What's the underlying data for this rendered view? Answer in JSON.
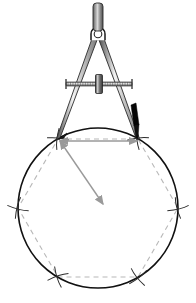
{
  "figure": {
    "background_color": "#ffffff",
    "width": 196,
    "height": 303
  },
  "colors": {
    "ink_black": "#1a1a1a",
    "circle_stroke": "#111111",
    "construction_grey": "#b3b3b3",
    "arrow_grey": "#9a9a9a",
    "metal_light": "#f2f2f2",
    "metal_mid": "#b8b8b8",
    "metal_dark": "#4a4a4a",
    "lead_black": "#000000",
    "handle_fill": "#8c8c8c"
  },
  "circle": {
    "label": "construction-circle",
    "center_x": 98,
    "center_y": 208,
    "radius": 80,
    "stroke_width": 1.6,
    "stroke_color": "#111111"
  },
  "hexagon": {
    "label": "inscribed-hexagon",
    "sides": 6,
    "style": "dashed",
    "stroke_color": "#b8b8b8",
    "stroke_width": 1.1,
    "dash_pattern": "5 4",
    "vertices": [
      {
        "name": "vertex-top-left",
        "x": 58,
        "y": 139
      },
      {
        "name": "vertex-top-right",
        "x": 138,
        "y": 139
      },
      {
        "name": "vertex-right",
        "x": 178,
        "y": 208
      },
      {
        "name": "vertex-bottom-right",
        "x": 138,
        "y": 277
      },
      {
        "name": "vertex-bottom-left",
        "x": 58,
        "y": 277
      },
      {
        "name": "vertex-left",
        "x": 18,
        "y": 208
      }
    ]
  },
  "arc_marks": {
    "label": "compass-arc-crossings",
    "stroke_color": "#2b2b2b",
    "stroke_width": 1.0,
    "marks": [
      {
        "name": "arc-mark-left",
        "x": 18,
        "y": 208,
        "rotation": 14
      },
      {
        "name": "arc-mark-right",
        "x": 178,
        "y": 208,
        "rotation": -14
      },
      {
        "name": "arc-mark-bottom-left",
        "x": 58,
        "y": 277,
        "rotation": 72
      },
      {
        "name": "arc-mark-bottom-right",
        "x": 138,
        "y": 277,
        "rotation": -38
      },
      {
        "name": "arc-mark-top-left",
        "x": 58,
        "y": 139,
        "rotation": 96
      },
      {
        "name": "arc-mark-top-right",
        "x": 138,
        "y": 139,
        "rotation": 84
      }
    ]
  },
  "radius_arrow": {
    "label": "radius-measure-arrow",
    "from_x": 60,
    "from_y": 141,
    "to_x": 103,
    "to_y": 204,
    "color": "#9a9a9a",
    "stroke_width": 1.4,
    "double_headed": true
  },
  "chord_arrow": {
    "label": "chord-measure-arrow",
    "from_x": 60,
    "from_y": 141,
    "to_x": 137,
    "to_y": 141,
    "color": "#9a9a9a",
    "stroke_width": 1.4,
    "double_headed": true
  },
  "compass": {
    "label": "drawing-compass",
    "pivot_x": 98,
    "pivot_y": 34,
    "handle": {
      "name": "compass-handle",
      "x": 93,
      "y": 3,
      "width": 10,
      "height": 28,
      "fill": "#8c8c8c"
    },
    "hinge": {
      "name": "compass-hinge",
      "cx": 98,
      "cy": 34,
      "r": 7
    },
    "left_leg": {
      "name": "compass-needle-leg",
      "top_x": 95,
      "top_y": 38,
      "tip_x": 58,
      "tip_y": 139,
      "tip_type": "needle-point"
    },
    "right_leg": {
      "name": "compass-pencil-leg",
      "top_x": 101,
      "top_y": 38,
      "tip_x": 138,
      "tip_y": 139,
      "tip_type": "pencil-lead"
    },
    "crossbar": {
      "name": "compass-threaded-crossbar",
      "x1": 66,
      "x2": 132,
      "y": 84,
      "thread_ticks": 26
    },
    "adjust_wheel": {
      "name": "compass-adjustment-wheel",
      "cx": 99,
      "cy": 84,
      "width": 7,
      "height": 19
    }
  },
  "caption": {
    "alt_text": "A pair of compasses set to the circle radius steps six equal chords around the circle, producing an inscribed regular hexagon shown with dashed construction lines and arc crossing marks."
  }
}
